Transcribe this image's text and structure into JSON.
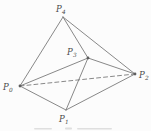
{
  "figure": {
    "background_color": "#fcfcfc",
    "line_color": "#7a7a7a",
    "label_color": "#4a4a4a",
    "dot_color": "#5e5e5e",
    "label_font_size": 8.5,
    "subscript_font_size": 5.8,
    "edge_width": 0.9,
    "dash_pattern": "4,3",
    "vertices": {
      "P0": {
        "x": 20,
        "y": 86,
        "label": "P",
        "sub": "0",
        "label_x": 3,
        "label_y": 90,
        "dot": true
      },
      "P1": {
        "x": 66,
        "y": 110,
        "label": "P",
        "sub": "1",
        "label_x": 59,
        "label_y": 122,
        "dot": false
      },
      "P2": {
        "x": 135,
        "y": 74,
        "label": "P",
        "sub": "2",
        "label_x": 139,
        "label_y": 78,
        "dot": true
      },
      "P3": {
        "x": 88,
        "y": 58,
        "label": "P",
        "sub": "3",
        "label_x": 67,
        "label_y": 55,
        "dot": true
      },
      "P4": {
        "x": 63,
        "y": 17,
        "label": "P",
        "sub": "4",
        "label_x": 56,
        "label_y": 12,
        "dot": false
      }
    },
    "edges": [
      {
        "from": "P4",
        "to": "P0",
        "style": "solid"
      },
      {
        "from": "P4",
        "to": "P3",
        "style": "solid"
      },
      {
        "from": "P4",
        "to": "P2",
        "style": "solid"
      },
      {
        "from": "P0",
        "to": "P3",
        "style": "solid"
      },
      {
        "from": "P3",
        "to": "P2",
        "style": "solid"
      },
      {
        "from": "P3",
        "to": "P1",
        "style": "solid"
      },
      {
        "from": "P0",
        "to": "P1",
        "style": "solid"
      },
      {
        "from": "P1",
        "to": "P2",
        "style": "solid"
      },
      {
        "from": "P0",
        "to": "P2",
        "style": "dashed"
      }
    ],
    "caption_remnants": [
      {
        "x": 34,
        "y": 128,
        "w": 18,
        "h": 1.6
      },
      {
        "x": 65,
        "y": 127.5,
        "w": 7,
        "h": 2.0
      },
      {
        "x": 77,
        "y": 128,
        "w": 35,
        "h": 1.6
      }
    ]
  }
}
